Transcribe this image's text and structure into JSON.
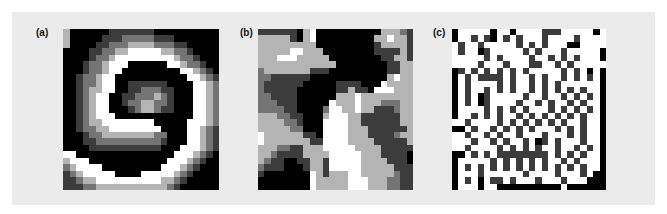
{
  "figure": {
    "background": "#ebebeb",
    "grays": [
      "#000000",
      "#3c3c3c",
      "#747474",
      "#b4b4b4",
      "#ffffff"
    ],
    "panels": [
      {
        "label": "(a)",
        "description": "spiral pattern",
        "rows": [
          "300000011111110000000000",
          "300000111222221110000000",
          "300001122233332221100000",
          "000011223344444332210000",
          "000012234444444443221000",
          "000122344400000044322100",
          "000122344000000000443210",
          "001223440000000000044321",
          "001223440011111100004432",
          "001233440011222110004432",
          "001234400112223210004432",
          "001234400122332210004432",
          "001234400012332110004432",
          "001234440000000000004432",
          "001233444444440000044432",
          "001223344444444000044321",
          "000122333333332200044321",
          "000112222222222100044321",
          "000011111111111000444321",
          "440000000000000004443210",
          "344400000000000044432100",
          "234444000000000444321000",
          "123444440000444443210000",
          "112334444444444332100000",
          "111223333333333321000000"
        ]
      },
      {
        "label": "(b)",
        "description": "random blob pattern",
        "rows": [
          "111111034000000000033321",
          "333331034000000000334331",
          "333333333000000000133331",
          "333334433300000000111131",
          "333444333330000000011331",
          "333333333333000000001133",
          "233333331110000000001133",
          "221111110000000000003433",
          "211111100000111100043333",
          "211111000000113110444333",
          "221111000000333433333333",
          "222111000004333433322233",
          "222211000024433433111233",
          "333221100034443311111133",
          "333322100044443311111133",
          "333332200044443331111113",
          "433333311044443331111233",
          "433333331144443333111113",
          "333221133344444333311111",
          "332111133334444433311110",
          "321100113314444433331110",
          "211100013314444433333111",
          "100000004313334433333211",
          "000000004333334443332211",
          "000000004333334443332211"
        ]
      },
      {
        "label": "(c)",
        "description": "sparse square dot maze pattern",
        "rows": [
          "044444044044441114444404",
          "044141041414441444414444",
          "414414444414141444004444",
          "414401444441414441444440",
          "444441414444144141414440",
          "444414441444114414144444",
          "014141414141444441414040",
          "041411114144141441414140",
          "041444414144141414444440",
          "041441414144141414141440",
          "041401444441441441414140",
          "041401444414414144141440",
          "044441414141444141414140",
          "044141414414141414141440",
          "441444414141414141441440",
          "004144141414144414141440",
          "441441414414441444141440",
          "444144141441401414441440",
          "441444414141414414414140",
          "004141411111111414141440",
          "044444141414141441414440",
          "041414141414141414141440",
          "044414444441444414441400",
          "041404114144414441444000",
          "044404400000000004000000"
        ]
      }
    ]
  }
}
